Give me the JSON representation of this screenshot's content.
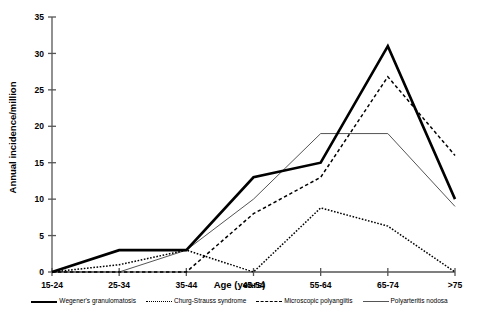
{
  "chart_data": {
    "type": "line",
    "title": "",
    "xlabel": "Age (years)",
    "ylabel": "Annual incidence/million",
    "categories": [
      "15-24",
      "25-34",
      "35-44",
      "45-54",
      "55-64",
      "65-74",
      ">75"
    ],
    "ylim": [
      0,
      35
    ],
    "yticks": [
      0,
      5,
      10,
      15,
      20,
      25,
      30,
      35
    ],
    "grid": false,
    "legend_position": "bottom",
    "series": [
      {
        "name": "Wegener's granulomatosis",
        "style": "solid-thick",
        "color": "#000000",
        "values": [
          0,
          3,
          3,
          13,
          15,
          31,
          10
        ]
      },
      {
        "name": "Churg-Strauss syndrome",
        "style": "dotted",
        "color": "#000000",
        "values": [
          0,
          1,
          3,
          0,
          8.8,
          6.3,
          0
        ]
      },
      {
        "name": "Microscopic polyangiitis",
        "style": "dashed",
        "color": "#000000",
        "values": [
          0,
          0,
          0,
          8,
          13,
          26.8,
          16
        ]
      },
      {
        "name": "Polyarteritis nodosa",
        "style": "solid-thin",
        "color": "#555555",
        "values": [
          0,
          0,
          3,
          10,
          19,
          19,
          9
        ]
      }
    ]
  },
  "axes": {
    "y_tick_labels": [
      "0",
      "5",
      "10",
      "15",
      "20",
      "25",
      "30",
      "35"
    ],
    "x_tick_labels": [
      "15-24",
      "25-34",
      "35-44",
      "45-54",
      "55-64",
      "65-74",
      ">75"
    ],
    "y_axis_title": "Annual incidence/million",
    "x_axis_title": "Age (years)"
  },
  "legend": {
    "items": [
      {
        "label": "Wegener's granulomatosis",
        "swatch": "sw-thick"
      },
      {
        "label": "Churg-Strauss syndrome",
        "swatch": "sw-dotted"
      },
      {
        "label": "Microscopic polyangiitis",
        "swatch": "sw-dashed"
      },
      {
        "label": "Polyarteritis nodosa",
        "swatch": "sw-thin"
      }
    ]
  }
}
